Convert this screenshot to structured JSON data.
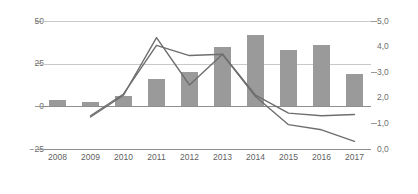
{
  "chart_data": {
    "type": "bar",
    "title": "",
    "xlabel": "",
    "ylabel": "",
    "categories": [
      "2008",
      "2009",
      "2010",
      "2011",
      "2012",
      "2013",
      "2014",
      "2015",
      "2016",
      "2017"
    ],
    "grid": true,
    "legend": "none",
    "axes": {
      "left": {
        "ylim": [
          -25,
          50
        ],
        "ticks": [
          50,
          25,
          0,
          -25
        ],
        "tick_labels": [
          "50",
          "25",
          "0",
          "−25"
        ]
      },
      "right": {
        "ylim": [
          0.0,
          5.0
        ],
        "ticks": [
          5.0,
          4.0,
          3.0,
          2.0,
          1.0,
          0.0
        ],
        "tick_labels": [
          "5,0",
          "4,0",
          "3,0",
          "2,0",
          "1,0",
          "0,0"
        ]
      }
    },
    "series": [
      {
        "name": "bars",
        "type": "bar",
        "axis": "left",
        "color": "#9a9a9a",
        "values": [
          4,
          2.5,
          6,
          16,
          20,
          35,
          42,
          33,
          36,
          19
        ]
      },
      {
        "name": "line-a",
        "type": "line",
        "axis": "right",
        "color": "#6e6e6e",
        "values": [
          null,
          1.25,
          2.1,
          4.35,
          2.5,
          3.7,
          2.05,
          0.95,
          0.75,
          0.3
        ]
      },
      {
        "name": "line-b",
        "type": "line",
        "axis": "right",
        "color": "#6e6e6e",
        "values": [
          null,
          1.3,
          2.15,
          4.05,
          3.65,
          3.7,
          2.1,
          1.4,
          1.3,
          1.35
        ]
      }
    ]
  },
  "colors": {
    "bar": "#9a9a9a",
    "line": "#6e6e6e",
    "grid": "#c9c9c9",
    "axis": "#8e8e8e",
    "tick_text": "#6f6f6f",
    "background": "#ffffff"
  }
}
